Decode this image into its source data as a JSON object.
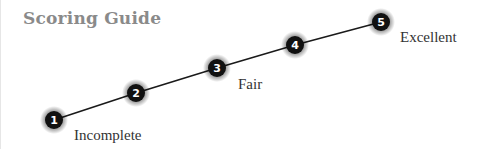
{
  "title": "Scoring Guide",
  "colors": {
    "title": "#8a8a8a",
    "line": "#1a1a1a",
    "node_fill": "#111111",
    "node_text": "#ffffff",
    "label_text": "#333333"
  },
  "scale": {
    "nodes": [
      {
        "number": "1",
        "x": 53,
        "y": 120
      },
      {
        "number": "2",
        "x": 135,
        "y": 93
      },
      {
        "number": "3",
        "x": 216,
        "y": 68
      },
      {
        "number": "4",
        "x": 294,
        "y": 45
      },
      {
        "number": "5",
        "x": 380,
        "y": 22
      }
    ],
    "labels": [
      {
        "text": "Incomplete",
        "for_node": "1"
      },
      {
        "text": "Fair",
        "for_node": "3"
      },
      {
        "text": "Excellent",
        "for_node": "5"
      }
    ]
  }
}
